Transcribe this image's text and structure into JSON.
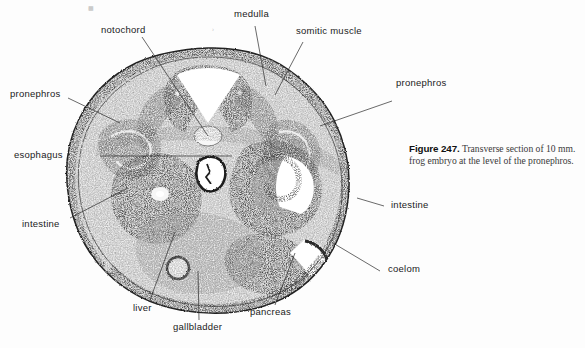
{
  "figure": {
    "number_label": "Figure 247.",
    "caption_text": "Transverse section of 10 mm. frog embryo at the level of the pronephros.",
    "specimen": "transverse section of 10 mm. frog embryo",
    "plate_marks": [
      "▉",
      "›"
    ]
  },
  "labels": [
    {
      "id": "notochord",
      "text": "notochord"
    },
    {
      "id": "medulla",
      "text": "medulla"
    },
    {
      "id": "somitic-muscle",
      "text": "somitic muscle"
    },
    {
      "id": "pronephros-left",
      "text": "pronephros"
    },
    {
      "id": "pronephros-right",
      "text": "pronephros"
    },
    {
      "id": "esophagus",
      "text": "esophagus"
    },
    {
      "id": "intestine-left",
      "text": "intestine"
    },
    {
      "id": "intestine-right",
      "text": "intestine"
    },
    {
      "id": "liver",
      "text": "liver"
    },
    {
      "id": "gallbladder",
      "text": "gallbladder"
    },
    {
      "id": "pancreas",
      "text": "pancreas"
    },
    {
      "id": "coelom",
      "text": "coelom"
    }
  ],
  "colors": {
    "page_background": "#fdfdfd",
    "ink": "#1b1b1b",
    "leader_line": "#2a2a2a",
    "tissue_dark": "#2b2b2b",
    "tissue_mid": "#6f6f6f",
    "tissue_light": "#c9c9c9",
    "lumen_white": "#ffffff",
    "caption_text": "#3a3a3a"
  },
  "structures": [
    {
      "name": "medulla",
      "description": "dark V-shaped neural tube with white inverted-V lumen, dorsal midline"
    },
    {
      "name": "notochord",
      "description": "small pale oval beneath the neural tube"
    },
    {
      "name": "somitic muscle",
      "description": "dorsolateral bands flanking the neural tube"
    },
    {
      "name": "pronephros",
      "description": "paired convoluted tubules in dorsolateral body wall, left and right"
    },
    {
      "name": "esophagus",
      "description": "small irregular dark-walled tube at the mid-line centre"
    },
    {
      "name": "intestine",
      "description": "coiled epithelial tube, right of centre, with white lumen"
    },
    {
      "name": "liver",
      "description": "large dark granular mass in the left half"
    },
    {
      "name": "gallbladder",
      "description": "small circular ring, ventral, left of midline"
    },
    {
      "name": "pancreas",
      "description": "granular mass ventro-right"
    },
    {
      "name": "coelom",
      "description": "body cavity space at the ventro-lateral right margin"
    }
  ]
}
